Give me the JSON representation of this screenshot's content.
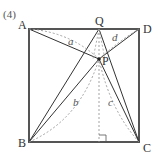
{
  "problem_label": "(4)",
  "points": {
    "A": {
      "label": "A",
      "x": 29,
      "y": 29
    },
    "D": {
      "label": "D",
      "x": 139,
      "y": 29
    },
    "B": {
      "label": "B",
      "x": 29,
      "y": 142
    },
    "C": {
      "label": "C",
      "x": 139,
      "y": 142
    },
    "Q": {
      "label": "Q",
      "x": 99,
      "y": 29
    },
    "P": {
      "label": "P",
      "x": 99,
      "y": 59
    }
  },
  "arc_labels": {
    "a": "a",
    "b": "b",
    "c": "c",
    "d": "d"
  },
  "colors": {
    "square": "#555555",
    "lines": "#333333",
    "dashed": "#999999"
  }
}
